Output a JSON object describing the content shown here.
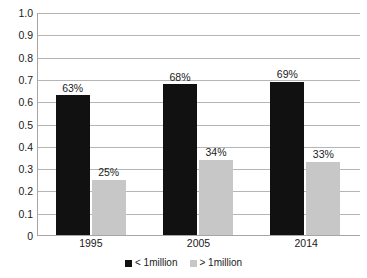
{
  "chart_data": {
    "type": "bar",
    "title": "",
    "subtitle": "",
    "xlabel": "",
    "ylabel": "",
    "categories": [
      "1995",
      "2005",
      "2014"
    ],
    "series": [
      {
        "name": "< 1million",
        "color": "#111111",
        "values": [
          0.63,
          0.68,
          0.69
        ],
        "labels": [
          "63%",
          "68%",
          "69%"
        ]
      },
      {
        "name": "> 1million",
        "color": "#c7c7c7",
        "values": [
          0.25,
          0.34,
          0.33
        ],
        "labels": [
          "25%",
          "34%",
          "33%"
        ]
      }
    ],
    "ylim": [
      0,
      1.0
    ],
    "ytick_values": [
      1.0,
      0.9,
      0.8,
      0.7,
      0.6,
      0.5,
      0.4,
      0.3,
      0.2,
      0.1,
      0
    ],
    "ytick_labels": [
      "1.0",
      "0.9",
      "0.8",
      "0.7",
      "0.6",
      "0.5",
      "0.4",
      "0.3",
      "0.2",
      "0.1",
      "0"
    ],
    "grid": "horizontal",
    "legend_position": "bottom",
    "plot_background": "#ffffff"
  }
}
